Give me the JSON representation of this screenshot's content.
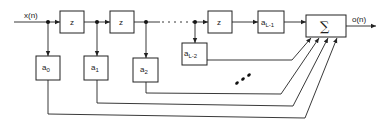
{
  "diagram": {
    "type": "FIR filter block diagram (tapped delay line)",
    "input_label": "x(n)",
    "output_label": "o(n)",
    "delay_label": "z",
    "sum_symbol": "∑",
    "coefficients": [
      {
        "base": "a",
        "sub": "0"
      },
      {
        "base": "a",
        "sub": "1"
      },
      {
        "base": "a",
        "sub": "2"
      },
      {
        "base": "a",
        "sub": "L-2"
      },
      {
        "base": "a",
        "sub": "L-1"
      }
    ],
    "ellipsis_top": "· · ·",
    "ellipsis_diag": "⋰"
  }
}
